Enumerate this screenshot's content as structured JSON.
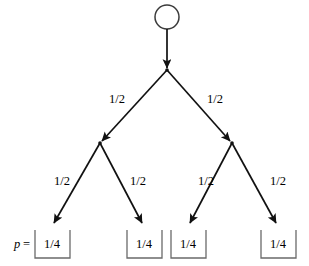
{
  "diagram": {
    "type": "probability-tree",
    "title": "",
    "root": {
      "name": "root-node",
      "shape": "circle",
      "cx": 167,
      "cy": 17,
      "r": 12
    },
    "level1_nodes": [
      {
        "name": "branch-node-root",
        "cx": 167,
        "cy": 70
      }
    ],
    "level2_nodes": [
      {
        "name": "branch-node-left",
        "cx": 100,
        "cy": 143
      },
      {
        "name": "branch-node-right",
        "cx": 232,
        "cy": 143
      }
    ],
    "edges": [
      {
        "name": "edge-root-stem",
        "label": "",
        "x1": 167,
        "y1": 29,
        "x2": 167,
        "y2": 70
      },
      {
        "name": "edge-root-left",
        "label": "1/2",
        "x1": 167,
        "y1": 70,
        "x2": 100,
        "y2": 143,
        "label_x": 117,
        "label_y": 100
      },
      {
        "name": "edge-root-right",
        "label": "1/2",
        "x1": 167,
        "y1": 70,
        "x2": 232,
        "y2": 143,
        "label_x": 215,
        "label_y": 100
      },
      {
        "name": "edge-left-leaf1",
        "label": "1/2",
        "x1": 100,
        "y1": 143,
        "x2": 52,
        "y2": 226,
        "label_x": 62,
        "label_y": 182
      },
      {
        "name": "edge-left-leaf2",
        "label": "1/2",
        "x1": 100,
        "y1": 143,
        "x2": 144,
        "y2": 226,
        "label_x": 138,
        "label_y": 182
      },
      {
        "name": "edge-right-leaf3",
        "label": "1/2",
        "x1": 232,
        "y1": 143,
        "x2": 188,
        "y2": 226,
        "label_x": 206,
        "label_y": 182
      },
      {
        "name": "edge-right-leaf4",
        "label": "1/2",
        "x1": 232,
        "y1": 143,
        "x2": 278,
        "y2": 226,
        "label_x": 278,
        "label_y": 182
      }
    ],
    "leaves": [
      {
        "name": "leaf-box-1",
        "value": "1/4",
        "cx": 52,
        "box_left": 35,
        "box_right": 70,
        "box_top": 232,
        "box_bottom": 258
      },
      {
        "name": "leaf-box-2",
        "value": "1/4",
        "cx": 144,
        "box_left": 127,
        "box_right": 162,
        "box_top": 232,
        "box_bottom": 258
      },
      {
        "name": "leaf-box-3",
        "value": "1/4",
        "cx": 188,
        "box_left": 171,
        "box_right": 206,
        "box_top": 232,
        "box_bottom": 258
      },
      {
        "name": "leaf-box-4",
        "value": "1/4",
        "cx": 278,
        "box_left": 261,
        "box_right": 296,
        "box_top": 232,
        "box_bottom": 258
      }
    ],
    "p_label": {
      "symbol": "p",
      "equals": "=",
      "symbol_x": 14,
      "equals_x": 24,
      "y": 245
    }
  },
  "colors": {
    "line": "#111111",
    "bracket": "#6a6a6a",
    "text": "#000000",
    "background": "#ffffff"
  }
}
